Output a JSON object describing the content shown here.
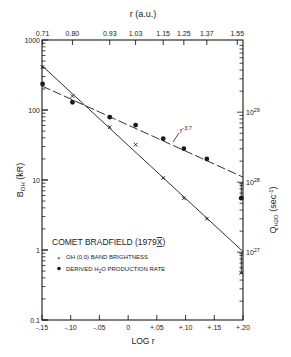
{
  "chart_data": {
    "type": "scatter",
    "title": "COMET BRADFIELD (1979X)",
    "title_parts": {
      "main": "COMET BRADFIELD (1979",
      "roman": "X",
      "end": ")"
    },
    "xlabel": "LOG r",
    "ylabel": "B_OH (kR)",
    "ylabel_parts": {
      "main": "B",
      "sub": "OH",
      "unit": " (kR)"
    },
    "top_xlabel": "r (a.u.)",
    "right_ylabel": "Q_H2O (sec^-1)",
    "right_ylabel_parts": {
      "main": "Q",
      "sub": "H2O",
      "unit": " (sec",
      "sup": "-1",
      "end": ")"
    },
    "xlim": [
      -0.15,
      0.2
    ],
    "ylim": [
      0.1,
      1000
    ],
    "yscale": "log",
    "x_ticks": [
      {
        "value": -0.15,
        "label": "-.15"
      },
      {
        "value": -0.1,
        "label": "-.10"
      },
      {
        "value": -0.05,
        "label": "-.05"
      },
      {
        "value": 0.0,
        "label": "0"
      },
      {
        "value": 0.05,
        "label": "+.05"
      },
      {
        "value": 0.1,
        "label": "+.10"
      },
      {
        "value": 0.15,
        "label": "+.15"
      },
      {
        "value": 0.2,
        "label": "+.20"
      }
    ],
    "top_ticks": [
      {
        "value": -0.149,
        "label": "0.71"
      },
      {
        "value": -0.097,
        "label": "0.80"
      },
      {
        "value": -0.032,
        "label": "0.93"
      },
      {
        "value": 0.013,
        "label": "1.03"
      },
      {
        "value": 0.061,
        "label": "1.15"
      },
      {
        "value": 0.097,
        "label": "1.25"
      },
      {
        "value": 0.137,
        "label": "1.37"
      },
      {
        "value": 0.19,
        "label": "1.55"
      }
    ],
    "y_ticks": [
      {
        "value": 1000,
        "label": "1000"
      },
      {
        "value": 100,
        "label": "100"
      },
      {
        "value": 10,
        "label": "10"
      },
      {
        "value": 1,
        "label": "1"
      },
      {
        "value": 0.1,
        "label": "0.1"
      }
    ],
    "right_ticks": [
      {
        "b_equiv": 93,
        "label_base": "10",
        "label_exp": "29"
      },
      {
        "b_equiv": 9.3,
        "label_base": "10",
        "label_exp": "28"
      },
      {
        "b_equiv": 0.93,
        "label_base": "10",
        "label_exp": "27"
      }
    ],
    "series": [
      {
        "name": "OH (0,0) BAND BRIGHTNESS",
        "marker": "x",
        "line": "solid",
        "x": [
          -0.149,
          -0.097,
          -0.032,
          0.013,
          0.061,
          0.097,
          0.137,
          0.197
        ],
        "y": [
          410,
          158,
          57,
          32,
          10.7,
          5.5,
          2.8,
          0.47
        ],
        "fit_line": {
          "x": [
            -0.15,
            0.2
          ],
          "y": [
            430,
            0.95
          ]
        },
        "error_bar_last": {
          "y_upper": 0.9,
          "y_lower": 0.47
        }
      },
      {
        "name": "DERIVED H2O PRODUCTION RATE",
        "marker": "dot",
        "line": "dashed",
        "x": [
          -0.149,
          -0.097,
          -0.032,
          0.013,
          0.061,
          0.097,
          0.137,
          0.197
        ],
        "y": [
          236,
          129,
          79,
          61,
          39,
          28,
          20,
          5.5
        ],
        "fit_line": {
          "x": [
            -0.15,
            0.2
          ],
          "y": [
            220,
            11
          ]
        },
        "error_bar_last": {
          "y_upper": 9.0,
          "y_lower": 5.5
        },
        "annotation": "r^-3.7"
      }
    ],
    "annotation": {
      "text": "r",
      "sup": "-3.7"
    },
    "legend": [
      {
        "marker": "x",
        "label": "OH (0,0) BAND BRIGHTNESS"
      },
      {
        "marker": "dot",
        "label_main": "DERIVED H",
        "label_sub": "2",
        "label_end": "O PRODUCTION RATE"
      }
    ],
    "grid": false,
    "legend_position": "lower-left inside"
  }
}
